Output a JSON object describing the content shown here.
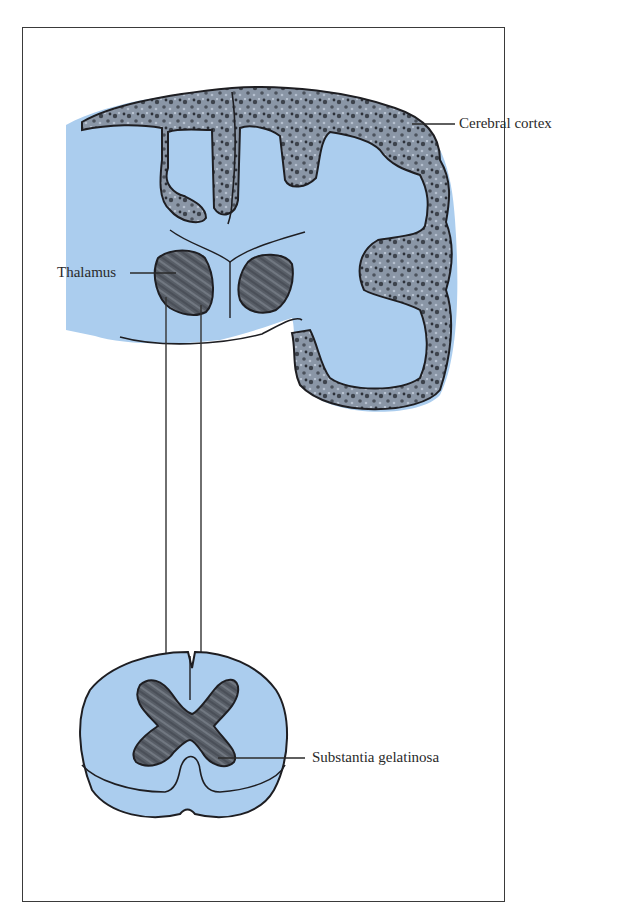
{
  "figure": {
    "type": "anatomical-diagram",
    "colors": {
      "tissue_blue": "#abcdee",
      "gray_matter": "#5f6670",
      "outline": "#1e1e22",
      "frame": "#3a3a3a",
      "label_text": "#2a2a2a"
    },
    "labels": {
      "cerebral_cortex": "Cerebral cortex",
      "thalamus": "Thalamus",
      "substantia_gelatinosa": "Substantia gelatinosa"
    },
    "structures": [
      {
        "id": "brain-coronal-section",
        "description": "Half coronal section of the brain with folded cortex"
      },
      {
        "id": "thalamus-left",
        "description": "Left thalamus (labeled)"
      },
      {
        "id": "thalamus-right",
        "description": "Right thalamus"
      },
      {
        "id": "spinal-cord-section",
        "description": "Spinal cord cross-section with butterfly-shaped gray matter"
      },
      {
        "id": "pathway-lines",
        "description": "Two vertical fibers ascending from spinal cord dorsal horn to thalamus"
      }
    ]
  }
}
